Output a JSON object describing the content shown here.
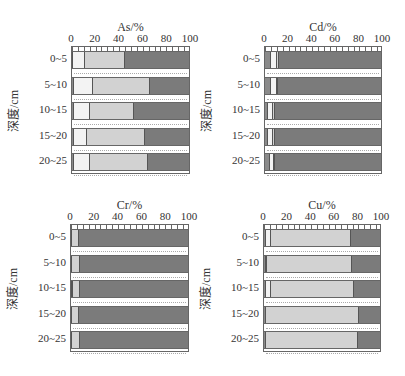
{
  "chart_data": [
    {
      "type": "bar",
      "orientation": "horizontal",
      "stacked": true,
      "title": "As/%",
      "xlabel": "As/%",
      "ylabel": "深度/cm",
      "xlim": [
        0,
        100
      ],
      "xticks": [
        "0",
        "20",
        "40",
        "60",
        "80",
        "100"
      ],
      "categories": [
        "0~5",
        "5~10",
        "10~15",
        "15~20",
        "20~25"
      ],
      "series": [
        {
          "name": "fraction 1",
          "color": "#8a8a8a",
          "values": [
            1,
            2,
            2,
            2,
            2
          ]
        },
        {
          "name": "fraction 2",
          "color": "#f3f3f3",
          "values": [
            10,
            16,
            13,
            11,
            13
          ]
        },
        {
          "name": "fraction 3",
          "color": "#d2d2d2",
          "values": [
            34,
            49,
            38,
            49,
            50
          ]
        },
        {
          "name": "fraction 4",
          "color": "#7b7b7b",
          "values": [
            55,
            33,
            47,
            38,
            35
          ]
        }
      ]
    },
    {
      "type": "bar",
      "orientation": "horizontal",
      "stacked": true,
      "title": "Cd/%",
      "xlabel": "Cd/%",
      "ylabel": "深度/cm",
      "xlim": [
        0,
        100
      ],
      "xticks": [
        "0",
        "20",
        "40",
        "60",
        "80",
        "100"
      ],
      "categories": [
        "0~5",
        "5~10",
        "10~15",
        "15~20",
        "20~25"
      ],
      "series": [
        {
          "name": "fraction 1",
          "color": "#8a8a8a",
          "values": [
            5,
            5,
            3,
            3,
            4
          ]
        },
        {
          "name": "fraction 2",
          "color": "#f3f3f3",
          "values": [
            5,
            5,
            4,
            4,
            4
          ]
        },
        {
          "name": "fraction 3",
          "color": "#d2d2d2",
          "values": [
            2,
            1,
            2,
            2,
            1
          ]
        },
        {
          "name": "fraction 4",
          "color": "#7b7b7b",
          "values": [
            88,
            89,
            91,
            91,
            91
          ]
        }
      ]
    },
    {
      "type": "bar",
      "orientation": "horizontal",
      "stacked": true,
      "title": "Cr/%",
      "xlabel": "Cr/%",
      "ylabel": "深度/cm",
      "xlim": [
        0,
        100
      ],
      "xticks": [
        "0",
        "20",
        "40",
        "60",
        "80",
        "100"
      ],
      "categories": [
        "0~5",
        "5~10",
        "10~15",
        "15~20",
        "20~25"
      ],
      "series": [
        {
          "name": "fraction 1",
          "color": "#8a8a8a",
          "values": [
            1,
            1,
            1,
            1,
            1
          ]
        },
        {
          "name": "fraction 2",
          "color": "#f3f3f3",
          "values": [
            0,
            0,
            1,
            0,
            0
          ]
        },
        {
          "name": "fraction 3",
          "color": "#d2d2d2",
          "values": [
            6,
            7,
            6,
            6,
            7
          ]
        },
        {
          "name": "fraction 4",
          "color": "#7b7b7b",
          "values": [
            93,
            92,
            92,
            93,
            92
          ]
        }
      ]
    },
    {
      "type": "bar",
      "orientation": "horizontal",
      "stacked": true,
      "title": "Cu/%",
      "xlabel": "Cu/%",
      "ylabel": "深度/cm",
      "xlim": [
        0,
        100
      ],
      "xticks": [
        "0",
        "20",
        "40",
        "60",
        "80",
        "100"
      ],
      "categories": [
        "0~5",
        "5~10",
        "10~15",
        "15~20",
        "20~25"
      ],
      "series": [
        {
          "name": "fraction 1",
          "color": "#8a8a8a",
          "values": [
            2,
            2,
            2,
            2,
            2
          ]
        },
        {
          "name": "fraction 2",
          "color": "#f3f3f3",
          "values": [
            4,
            1,
            4,
            0,
            0
          ]
        },
        {
          "name": "fraction 3",
          "color": "#d2d2d2",
          "values": [
            69,
            73,
            72,
            80,
            79
          ]
        },
        {
          "name": "fraction 4",
          "color": "#7b7b7b",
          "values": [
            25,
            24,
            22,
            18,
            19
          ]
        }
      ]
    }
  ],
  "panels": [
    {
      "title": "As/%",
      "ylabel": "深度/cm"
    },
    {
      "title": "Cd/%",
      "ylabel": "深度/cm"
    },
    {
      "title": "Cr/%",
      "ylabel": "深度/cm"
    },
    {
      "title": "Cu/%",
      "ylabel": "深度/cm"
    }
  ],
  "ticks": [
    "0",
    "20",
    "40",
    "60",
    "80",
    "100"
  ],
  "rows": [
    "0~5",
    "5~10",
    "10~15",
    "15~20",
    "20~25"
  ]
}
